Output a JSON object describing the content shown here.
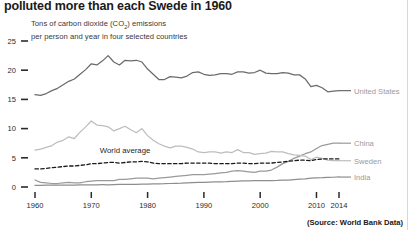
{
  "header": {
    "title": "polluted more than each Swede in 1960"
  },
  "subtitle": {
    "line1_pre": "Tons of carbon dioxide (CO",
    "line1_sub": "2",
    "line1_post": ") emissions",
    "line2": "per person and year in four selected countries"
  },
  "source": {
    "text": "(Source: World Bank Data)"
  },
  "axes": {
    "y_ticks": [
      "0",
      "5",
      "10",
      "15",
      "20",
      "25"
    ],
    "x_ticks": [
      "1960",
      "1970",
      "1980",
      "1990",
      "2000",
      "2010",
      "2014"
    ]
  },
  "labels": {
    "united_states": "United States",
    "china": "China",
    "sweden": "Sweden",
    "india": "India",
    "world_average": "World average"
  },
  "colors": {
    "united_states": "#6b6b6b",
    "china": "#9a9a9a",
    "sweden": "#bdbdbd",
    "india": "#8e8e8e",
    "world_average": "#1a1a1a",
    "axis": "#2b2b2b",
    "label_text": "#9a9a9a",
    "frame": "#d8d8d8"
  },
  "chart_data": {
    "type": "line",
    "title": "polluted more than each Swede in 1960",
    "subtitle": "Tons of carbon dioxide (CO2) emissions per person and year in four selected countries",
    "xlabel": "",
    "ylabel": "Tons of CO2 per person per year",
    "xlim": [
      1960,
      2014
    ],
    "ylim": [
      0,
      25
    ],
    "grid": false,
    "legend_position": "right-inline",
    "x_tick_values": [
      1960,
      1970,
      1980,
      1990,
      2000,
      2010,
      2014
    ],
    "y_tick_values": [
      0,
      5,
      10,
      15,
      20,
      25
    ],
    "annotations": [
      {
        "text": "World average",
        "x": 1976,
        "y": 5.9
      }
    ],
    "x": [
      1960,
      1961,
      1962,
      1963,
      1964,
      1965,
      1966,
      1967,
      1968,
      1969,
      1970,
      1971,
      1972,
      1973,
      1974,
      1975,
      1976,
      1977,
      1978,
      1979,
      1980,
      1981,
      1982,
      1983,
      1984,
      1985,
      1986,
      1987,
      1988,
      1989,
      1990,
      1991,
      1992,
      1993,
      1994,
      1995,
      1996,
      1997,
      1998,
      1999,
      2000,
      2001,
      2002,
      2003,
      2004,
      2005,
      2006,
      2007,
      2008,
      2009,
      2010,
      2011,
      2012,
      2013,
      2014
    ],
    "series": [
      {
        "name": "United States",
        "color": "#6b6b6b",
        "style": "solid",
        "end_value": 16.5,
        "peak": {
          "year": 1973,
          "value": 22.5
        },
        "values": [
          15.8,
          15.7,
          16.0,
          16.5,
          16.9,
          17.5,
          18.1,
          18.5,
          19.3,
          20.1,
          21.1,
          20.9,
          21.6,
          22.5,
          21.4,
          20.9,
          21.7,
          21.6,
          21.7,
          21.4,
          20.2,
          19.3,
          18.4,
          18.4,
          18.9,
          18.8,
          18.7,
          19.0,
          19.6,
          19.7,
          19.3,
          19.1,
          19.2,
          19.4,
          19.4,
          19.3,
          19.7,
          19.7,
          19.5,
          19.6,
          20.0,
          19.5,
          19.4,
          19.4,
          19.6,
          19.5,
          19.2,
          19.2,
          18.5,
          17.2,
          17.4,
          17.0,
          16.3,
          16.4,
          16.5
        ]
      },
      {
        "name": "China",
        "color": "#9a9a9a",
        "style": "solid",
        "end_value": 7.5,
        "values": [
          1.2,
          0.8,
          0.7,
          0.6,
          0.6,
          0.7,
          0.8,
          0.7,
          0.7,
          0.9,
          1.0,
          1.1,
          1.1,
          1.1,
          1.1,
          1.3,
          1.3,
          1.4,
          1.5,
          1.5,
          1.5,
          1.4,
          1.5,
          1.6,
          1.7,
          1.8,
          1.9,
          2.0,
          2.1,
          2.1,
          2.1,
          2.2,
          2.3,
          2.4,
          2.5,
          2.7,
          2.8,
          2.7,
          2.6,
          2.5,
          2.7,
          2.7,
          2.9,
          3.4,
          4.0,
          4.4,
          4.9,
          5.3,
          5.7,
          6.0,
          6.6,
          7.1,
          7.3,
          7.5,
          7.5
        ]
      },
      {
        "name": "Sweden",
        "color": "#bdbdbd",
        "style": "solid",
        "end_value": 4.5,
        "peak": {
          "year": 1970,
          "value": 11.3
        },
        "values": [
          6.3,
          6.5,
          6.8,
          7.1,
          7.7,
          8.0,
          8.6,
          8.3,
          9.4,
          10.3,
          11.3,
          10.6,
          10.5,
          10.3,
          9.6,
          10.0,
          10.4,
          9.8,
          9.3,
          10.0,
          8.8,
          8.0,
          7.4,
          7.0,
          6.7,
          7.0,
          7.0,
          6.8,
          6.5,
          6.0,
          5.9,
          6.0,
          6.0,
          5.8,
          6.0,
          5.9,
          6.4,
          5.9,
          5.9,
          5.6,
          5.7,
          5.8,
          6.1,
          6.0,
          6.0,
          5.7,
          5.5,
          5.4,
          5.3,
          4.7,
          5.1,
          4.9,
          4.6,
          4.5,
          4.5
        ]
      },
      {
        "name": "India",
        "color": "#8e8e8e",
        "style": "solid",
        "end_value": 1.7,
        "values": [
          0.27,
          0.29,
          0.31,
          0.32,
          0.33,
          0.34,
          0.34,
          0.34,
          0.35,
          0.37,
          0.37,
          0.38,
          0.39,
          0.38,
          0.4,
          0.43,
          0.45,
          0.46,
          0.46,
          0.49,
          0.49,
          0.53,
          0.55,
          0.56,
          0.6,
          0.64,
          0.66,
          0.7,
          0.74,
          0.79,
          0.8,
          0.84,
          0.87,
          0.88,
          0.91,
          0.97,
          1.0,
          1.04,
          1.05,
          1.09,
          1.1,
          1.1,
          1.11,
          1.12,
          1.16,
          1.19,
          1.25,
          1.33,
          1.41,
          1.51,
          1.57,
          1.59,
          1.65,
          1.67,
          1.73
        ]
      },
      {
        "name": "World average",
        "color": "#1a1a1a",
        "style": "dashed",
        "end_value": 4.8,
        "values": [
          3.1,
          3.1,
          3.2,
          3.3,
          3.4,
          3.5,
          3.6,
          3.6,
          3.7,
          3.8,
          4.0,
          4.0,
          4.1,
          4.2,
          4.2,
          4.1,
          4.2,
          4.3,
          4.3,
          4.4,
          4.3,
          4.1,
          4.0,
          4.0,
          4.0,
          4.0,
          4.0,
          4.1,
          4.1,
          4.1,
          4.1,
          4.1,
          4.0,
          4.0,
          4.0,
          4.0,
          4.1,
          4.1,
          4.0,
          4.0,
          4.1,
          4.1,
          4.1,
          4.2,
          4.3,
          4.4,
          4.5,
          4.6,
          4.6,
          4.5,
          4.7,
          4.8,
          4.8,
          4.8,
          4.8
        ]
      }
    ]
  }
}
